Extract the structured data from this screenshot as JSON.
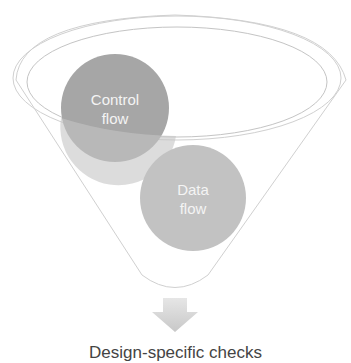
{
  "diagram": {
    "type": "funnel",
    "items": [
      {
        "line1": "Control",
        "line2": "flow",
        "color": "#9a9a9a"
      },
      {
        "line1": "Data",
        "line2": "flow",
        "color": "#b8b8b8"
      }
    ],
    "output_label": "Design-specific checks",
    "colors": {
      "outline": "#c8c8c8",
      "arrow": "#d4d4d4"
    }
  }
}
